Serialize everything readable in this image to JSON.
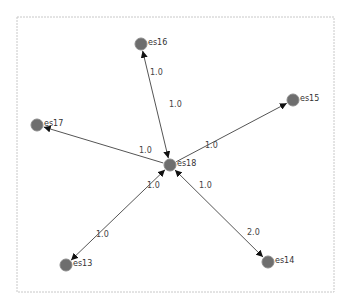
{
  "canvas": {
    "frame": {
      "x": 17,
      "y": 17,
      "w": 317,
      "h": 275
    },
    "colors": {
      "node_fill": "#6e6e6e",
      "edge": "#555555",
      "frame": "#c8c8c8",
      "text": "#333333"
    }
  },
  "nodes": [
    {
      "id": "es18",
      "label": "es18",
      "x": 170,
      "y": 165
    },
    {
      "id": "es16",
      "label": "es16",
      "x": 141,
      "y": 44
    },
    {
      "id": "es17",
      "label": "es17",
      "x": 37,
      "y": 125
    },
    {
      "id": "es15",
      "label": "es15",
      "x": 293,
      "y": 100
    },
    {
      "id": "es13",
      "label": "es13",
      "x": 66,
      "y": 265
    },
    {
      "id": "es14",
      "label": "es14",
      "x": 268,
      "y": 262
    }
  ],
  "edges": [
    {
      "from": "es18",
      "to": "es16",
      "bidirectional": true,
      "labels": [
        {
          "text": "1.0",
          "x": 150,
          "y": 75
        },
        {
          "text": "1.0",
          "x": 169,
          "y": 107
        }
      ]
    },
    {
      "from": "es18",
      "to": "es17",
      "bidirectional": false,
      "labels": [
        {
          "text": "1.0",
          "x": 139,
          "y": 153
        }
      ]
    },
    {
      "from": "es18",
      "to": "es15",
      "bidirectional": false,
      "labels": [
        {
          "text": "1.0",
          "x": 205,
          "y": 148
        }
      ]
    },
    {
      "from": "es18",
      "to": "es13",
      "bidirectional": true,
      "labels": [
        {
          "text": "1.0",
          "x": 147,
          "y": 188
        },
        {
          "text": "1.0",
          "x": 96,
          "y": 237
        }
      ]
    },
    {
      "from": "es18",
      "to": "es14",
      "bidirectional": true,
      "labels": [
        {
          "text": "1.0",
          "x": 199,
          "y": 188
        },
        {
          "text": "2.0",
          "x": 247,
          "y": 235
        }
      ]
    }
  ]
}
